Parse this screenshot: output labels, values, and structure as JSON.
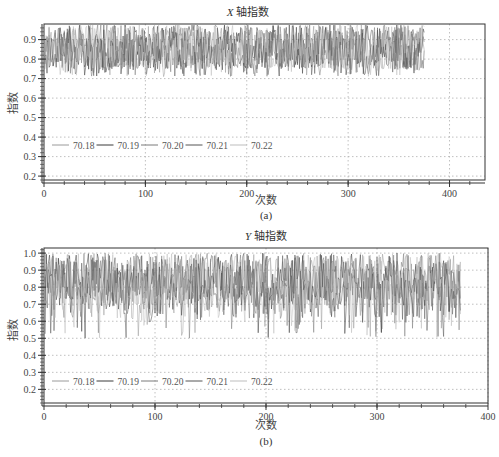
{
  "chart_data": [
    {
      "id": "a",
      "type": "line",
      "title": "X 轴指数",
      "title_italic_part": "X",
      "title_rest": " 轴指数",
      "xlabel": "次数",
      "ylabel": "指数",
      "caption": "(a)",
      "xlim": [
        0,
        435
      ],
      "ylim": [
        0.18,
        0.98
      ],
      "xticks": [
        0,
        100,
        200,
        300,
        400
      ],
      "yticks": [
        0.2,
        0.3,
        0.4,
        0.5,
        0.6,
        0.7,
        0.8,
        0.9
      ],
      "ytick_labels": [
        "0.2",
        "0.3",
        "0.4",
        "0.5",
        "0.6",
        "0.7",
        "0.8",
        "0.9"
      ],
      "grid": true,
      "legend": [
        "70.18",
        "70.19",
        "70.20",
        "70.21",
        "70.22"
      ],
      "legend_position": "lower-left inside",
      "series_summary": {
        "n_points": 375,
        "value_range": [
          0.71,
          0.98
        ],
        "typical_mean": 0.85,
        "description": "Five overlapping noisy series oscillating between ~0.71 and ~0.98 over ~375 samples"
      }
    },
    {
      "id": "b",
      "type": "line",
      "title": "Y 轴指数",
      "title_italic_part": "Y",
      "title_rest": " 轴指数",
      "xlabel": "次数",
      "ylabel": "指数",
      "caption": "(b)",
      "xlim": [
        0,
        400
      ],
      "ylim": [
        0.12,
        1.03
      ],
      "xticks": [
        0,
        100,
        200,
        300,
        400
      ],
      "yticks": [
        0.2,
        0.3,
        0.4,
        0.5,
        0.6,
        0.7,
        0.8,
        0.9,
        1.0
      ],
      "ytick_labels": [
        "0.2",
        "0.3",
        "0.4",
        "0.5",
        "0.6",
        "0.7",
        "0.8",
        "0.9",
        "1.0"
      ],
      "grid": true,
      "legend": [
        "70.18",
        "70.19",
        "70.20",
        "70.21",
        "70.22"
      ],
      "legend_position": "lower-left inside",
      "series_summary": {
        "n_points": 375,
        "value_range": [
          0.5,
          1.0
        ],
        "typical_mean": 0.82,
        "description": "Five overlapping noisy series mostly between ~0.7 and ~1.0 with frequent dips to ~0.5 over ~375 samples"
      }
    }
  ],
  "colors": {
    "axis": "#333333",
    "grid": "#b0b0b0",
    "series": [
      "#9a9a9a",
      "#3a3a3a",
      "#7a7a7a",
      "#555555",
      "#bdbdbd"
    ]
  }
}
